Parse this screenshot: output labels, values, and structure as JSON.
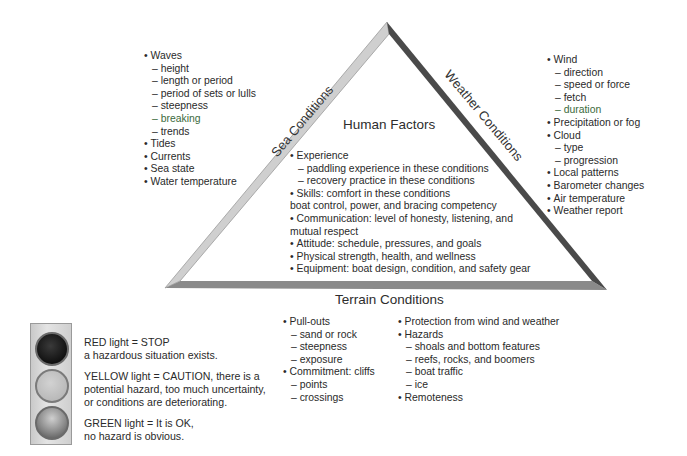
{
  "triangle": {
    "center_title": "Human Factors",
    "left_side_label": "Sea Conditions",
    "right_side_label": "Weather Conditions",
    "bottom_label": "Terrain Conditions",
    "colors": {
      "left_edge": "#c8c8c8",
      "right_edge": "#4a4a4a",
      "bottom_edge": "#8a8a8a",
      "accent_text": "#3c6a3c"
    }
  },
  "sea_conditions": {
    "items": [
      {
        "text": "Waves",
        "level": 0
      },
      {
        "text": "height",
        "level": 1
      },
      {
        "text": "length or period",
        "level": 1
      },
      {
        "text": "period of sets or lulls",
        "level": 1
      },
      {
        "text": "steepness",
        "level": 1
      },
      {
        "text": "breaking",
        "level": 1
      },
      {
        "text": "trends",
        "level": 1
      },
      {
        "text": "Tides",
        "level": 0
      },
      {
        "text": "Currents",
        "level": 0
      },
      {
        "text": "Sea state",
        "level": 0
      },
      {
        "text": "Water temperature",
        "level": 0
      }
    ]
  },
  "weather_conditions": {
    "items": [
      {
        "text": "Wind",
        "level": 0
      },
      {
        "text": "direction",
        "level": 1
      },
      {
        "text": "speed or force",
        "level": 1
      },
      {
        "text": "fetch",
        "level": 1
      },
      {
        "text": "duration",
        "level": 1
      },
      {
        "text": "Precipitation or fog",
        "level": 0
      },
      {
        "text": "Cloud",
        "level": 0
      },
      {
        "text": "type",
        "level": 1
      },
      {
        "text": "progression",
        "level": 1
      },
      {
        "text": "Local patterns",
        "level": 0
      },
      {
        "text": "Barometer changes",
        "level": 0
      },
      {
        "text": "Air temperature",
        "level": 0
      },
      {
        "text": "Weather report",
        "level": 0
      }
    ]
  },
  "human_factors": {
    "items": [
      {
        "text": "Experience",
        "level": 0
      },
      {
        "text": "paddling experience in these conditions",
        "level": 1
      },
      {
        "text": "recovery practice in these conditions",
        "level": 1
      },
      {
        "text": "Skills: comfort in these conditions",
        "level": 0
      },
      {
        "text": "boat control, power, and bracing competency",
        "level": 2
      },
      {
        "text": "Communication: level of honesty, listening, and",
        "level": 0
      },
      {
        "text": "mutual respect",
        "level": 2
      },
      {
        "text": "Attitude: schedule, pressures, and goals",
        "level": 0
      },
      {
        "text": "Physical strength, health, and wellness",
        "level": 0
      },
      {
        "text": "Equipment: boat design, condition, and safety gear",
        "level": 0
      }
    ]
  },
  "terrain_conditions": {
    "col1": [
      {
        "text": "Pull-outs",
        "level": 0
      },
      {
        "text": "sand or rock",
        "level": 1
      },
      {
        "text": "steepness",
        "level": 1
      },
      {
        "text": "exposure",
        "level": 1
      },
      {
        "text": "Commitment: cliffs",
        "level": 0
      },
      {
        "text": "points",
        "level": 1
      },
      {
        "text": "crossings",
        "level": 1
      }
    ],
    "col2": [
      {
        "text": "Protection from wind and weather",
        "level": 0
      },
      {
        "text": "Hazards",
        "level": 0
      },
      {
        "text": "shoals and bottom features",
        "level": 1
      },
      {
        "text": "reefs, rocks, and boomers",
        "level": 1
      },
      {
        "text": "boat traffic",
        "level": 1
      },
      {
        "text": "ice",
        "level": 1
      },
      {
        "text": "Remoteness",
        "level": 0
      }
    ]
  },
  "traffic_light_legend": {
    "red": {
      "line1": "RED light = STOP",
      "line2": "a hazardous situation exists."
    },
    "yellow": {
      "line1": "YELLOW light = CAUTION, there is a",
      "line2": "potential hazard, too much uncertainty,",
      "line3": "or conditions are deteriorating."
    },
    "green": {
      "line1": "GREEN light = It is OK,",
      "line2": "no hazard is obvious."
    }
  }
}
